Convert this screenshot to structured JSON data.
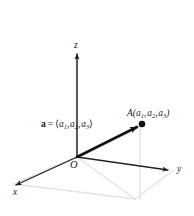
{
  "figure": {
    "background_color": "#ffffff",
    "axis_color": "#222222",
    "vector_color": "#111111",
    "projection_color": "#e3e3e3",
    "label_color": "#1a1a1a"
  },
  "axes": {
    "x_label": "x",
    "y_label": "y",
    "z_label": "z"
  },
  "origin": {
    "label": "O"
  },
  "point": {
    "name": "A",
    "open_paren": "(",
    "close_paren": ")",
    "comma": ",",
    "coord1_base": "a",
    "coord1_sub": "1",
    "coord2_base": "a",
    "coord2_sub": "2",
    "coord3_base": "a",
    "coord3_sub": "3"
  },
  "vector": {
    "symbol": "a",
    "equals": "=",
    "open_bracket": "⟨",
    "close_bracket": "⟩",
    "comma": ",",
    "comp1_base": "a",
    "comp1_sub": "1",
    "comp2_base": "a",
    "comp2_sub": "2",
    "comp3_base": "a",
    "comp3_sub": "3"
  },
  "caption": {
    "text": ""
  }
}
